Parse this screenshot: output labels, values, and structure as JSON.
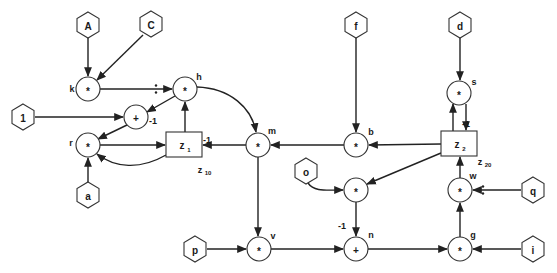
{
  "diagram": {
    "inputs": [
      {
        "id": "A",
        "label": "A",
        "x": 88,
        "y": 25
      },
      {
        "id": "C",
        "label": "C",
        "x": 151,
        "y": 24
      },
      {
        "id": "one",
        "label": "1",
        "x": 23,
        "y": 117
      },
      {
        "id": "a",
        "label": "a",
        "x": 88,
        "y": 195
      },
      {
        "id": "f",
        "label": "f",
        "x": 356,
        "y": 25
      },
      {
        "id": "d",
        "label": "d",
        "x": 460,
        "y": 25
      },
      {
        "id": "o",
        "label": "o",
        "x": 306,
        "y": 171
      },
      {
        "id": "q",
        "label": "q",
        "x": 533,
        "y": 190
      },
      {
        "id": "p",
        "label": "p",
        "x": 195,
        "y": 249
      },
      {
        "id": "i",
        "label": "i",
        "x": 533,
        "y": 249
      }
    ],
    "operators": [
      {
        "id": "k",
        "op": "*",
        "name": "k",
        "x": 88,
        "y": 89,
        "name_dx": -16,
        "name_dy": 0
      },
      {
        "id": "h",
        "op": "*",
        "name": "h",
        "x": 185,
        "y": 89,
        "name_dx": 14,
        "name_dy": -12
      },
      {
        "id": "plus1",
        "op": "+",
        "name": "",
        "x": 136,
        "y": 117,
        "name_dx": 0,
        "name_dy": 0
      },
      {
        "id": "r",
        "op": "*",
        "name": "r",
        "x": 88,
        "y": 145,
        "name_dx": -17,
        "name_dy": -2
      },
      {
        "id": "m",
        "op": "*",
        "name": "m",
        "x": 258,
        "y": 145,
        "name_dx": 14,
        "name_dy": -14
      },
      {
        "id": "b",
        "op": "*",
        "name": "b",
        "x": 356,
        "y": 145,
        "name_dx": 15,
        "name_dy": -13
      },
      {
        "id": "s",
        "op": "*",
        "name": "s",
        "x": 459,
        "y": 93,
        "name_dx": 15,
        "name_dy": -11
      },
      {
        "id": "mid",
        "op": "*",
        "name": "",
        "x": 356,
        "y": 190,
        "name_dx": 0,
        "name_dy": 0
      },
      {
        "id": "w",
        "op": "*",
        "name": "w",
        "x": 460,
        "y": 190,
        "name_dx": 13,
        "name_dy": -14
      },
      {
        "id": "v",
        "op": "*",
        "name": "v",
        "x": 259,
        "y": 249,
        "name_dx": 14,
        "name_dy": -13
      },
      {
        "id": "n",
        "op": "+",
        "name": "n",
        "x": 356,
        "y": 249,
        "name_dx": 15,
        "name_dy": -14
      },
      {
        "id": "g",
        "op": "*",
        "name": "g",
        "x": 460,
        "y": 249,
        "name_dx": 13,
        "name_dy": -14
      }
    ],
    "delays": [
      {
        "id": "z1",
        "label": "z",
        "sub": "1",
        "x": 166,
        "y": 132,
        "w": 36,
        "h": 25,
        "tag": "z",
        "tag_sub": "10",
        "tag_x": 200,
        "tag_y": 170
      },
      {
        "id": "z2",
        "label": "z",
        "sub": "2",
        "x": 441,
        "y": 131,
        "w": 36,
        "h": 25,
        "tag": "z",
        "tag_sub": "20",
        "tag_x": 480,
        "tag_y": 162
      }
    ],
    "annotations": [
      {
        "text": "-1",
        "x": 153,
        "y": 121
      },
      {
        "text": "-1",
        "x": 207,
        "y": 140
      },
      {
        "text": "-1",
        "x": 466,
        "y": 124
      },
      {
        "text": "-1",
        "x": 342,
        "y": 226
      }
    ],
    "divide_marks": [
      {
        "x": 156,
        "y": 89
      },
      {
        "x": 483,
        "y": 190
      }
    ]
  }
}
